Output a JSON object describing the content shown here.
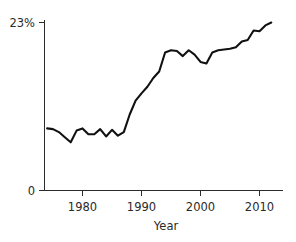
{
  "chart_data": {
    "type": "line",
    "title": "",
    "subtitle": "",
    "xlabel": "Year",
    "ylabel": "",
    "xlim": [
      1974,
      2012
    ],
    "ylim": [
      0,
      23
    ],
    "grid": false,
    "legend": null,
    "y_tick_labels": [
      "23%",
      "0"
    ],
    "y_ticks": [
      23,
      0
    ],
    "x_tick_labels": [
      "1980",
      "1990",
      "2000",
      "2010"
    ],
    "x_ticks": [
      1980,
      1990,
      2000,
      2010
    ],
    "y_unit": "%",
    "series": [
      {
        "name": "value",
        "x": [
          1974,
          1975,
          1976,
          1977,
          1978,
          1979,
          1980,
          1981,
          1982,
          1983,
          1984,
          1985,
          1986,
          1987,
          1988,
          1989,
          1990,
          1991,
          1992,
          1993,
          1994,
          1995,
          1996,
          1997,
          1998,
          1999,
          2000,
          2001,
          2002,
          2003,
          2004,
          2005,
          2006,
          2007,
          2008,
          2009,
          2010,
          2011,
          2012
        ],
        "values": [
          8.5,
          8.4,
          8.0,
          7.3,
          6.6,
          8.2,
          8.5,
          7.7,
          7.7,
          8.4,
          7.4,
          8.3,
          7.5,
          8.0,
          10.4,
          12.3,
          13.3,
          14.2,
          15.4,
          16.3,
          18.9,
          19.2,
          19.1,
          18.4,
          19.2,
          18.6,
          17.6,
          17.4,
          18.9,
          19.2,
          19.3,
          19.4,
          19.6,
          20.4,
          20.6,
          21.9,
          21.8,
          22.6,
          23.0
        ]
      }
    ]
  },
  "axes": {
    "x_axis_name": "year-axis",
    "y_axis_name": "percent-axis"
  }
}
